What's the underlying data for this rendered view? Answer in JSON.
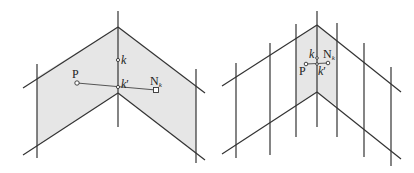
{
  "figure": {
    "panels": [
      {
        "id": "left",
        "description": "Bent planar surface with shaded region between two vertical lines; point P projected to neighbor N_k across crease",
        "labels": {
          "p": "P",
          "k": "k",
          "k_prime": "k",
          "k_prime_mark": "′",
          "n": "N",
          "n_sub": "k"
        }
      },
      {
        "id": "right",
        "description": "Same bent surface subdivided by many vertical lines; shaded region is narrow band around crease",
        "labels": {
          "p": "P",
          "k": "k",
          "k_prime": "k",
          "k_prime_mark": "′",
          "n": "N",
          "n_sub": "k"
        }
      }
    ],
    "colors": {
      "line": "#333333",
      "shade": "#e6e6e6",
      "background": "#ffffff"
    }
  }
}
